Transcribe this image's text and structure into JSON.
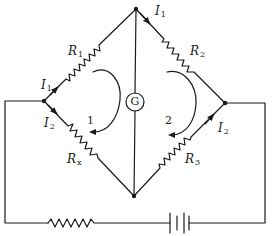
{
  "diagram": {
    "type": "wheatstone-bridge-circuit",
    "resistors": {
      "r1": {
        "symbol": "R",
        "subscript": "1"
      },
      "r2": {
        "symbol": "R",
        "subscript": "2"
      },
      "r3": {
        "symbol": "R",
        "subscript": "3"
      },
      "rx": {
        "symbol": "R",
        "subscript": "x"
      }
    },
    "currents": {
      "i1_left": {
        "symbol": "I",
        "subscript": "1"
      },
      "i1_right": {
        "symbol": "I",
        "subscript": "1"
      },
      "i2_left": {
        "symbol": "I",
        "subscript": "2"
      },
      "i2_right": {
        "symbol": "I",
        "subscript": "2"
      }
    },
    "galvanometer": {
      "label": "G"
    },
    "loops": [
      {
        "label": "1",
        "direction": "clockwise"
      },
      {
        "label": "2",
        "direction": "clockwise"
      }
    ],
    "source": {
      "battery": "battery",
      "series_resistor": "resistor"
    },
    "colors": {
      "line": "#1a1a1a",
      "background": "#ffffff"
    }
  }
}
